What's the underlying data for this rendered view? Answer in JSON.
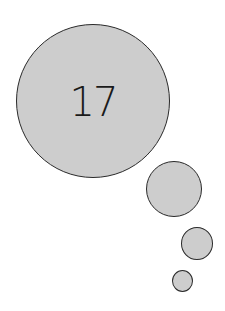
{
  "thought_bubble": {
    "number": "17",
    "fill_color": "#cdcdcd",
    "stroke_color": "#2a2a2a",
    "circles": [
      {
        "name": "main",
        "cx": 93,
        "cy": 101,
        "r": 77
      },
      {
        "name": "medium",
        "cx": 174,
        "cy": 189,
        "r": 28
      },
      {
        "name": "small",
        "cx": 197,
        "cy": 243,
        "r": 16
      },
      {
        "name": "tiny",
        "cx": 182,
        "cy": 281,
        "r": 11
      }
    ]
  }
}
